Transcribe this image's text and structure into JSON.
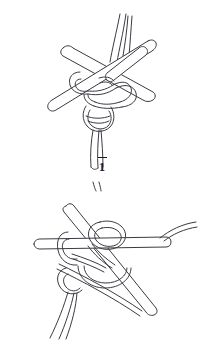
{
  "document": {
    "type": "line-art-illustration",
    "subject": "knot tied around crossed rods, two-step sequence",
    "background_color": "#ffffff",
    "stroke_color": "#3a3a42",
    "caption_color": "#1b1b1f"
  },
  "figures": [
    {
      "id": "figure-1",
      "caption": "1",
      "caption_has_overline": true,
      "description": "Knot with two cord ends rising at top, a pair of crossing rods, and a doubled cord descending below the knot"
    },
    {
      "id": "figure-2",
      "caption": "2",
      "caption_has_overline": true,
      "description": "Knot with horizontal rod through it, a diagonal rod crossing down to lower right, and two cord ends descending at lower left"
    }
  ]
}
